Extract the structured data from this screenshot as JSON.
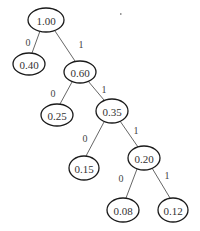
{
  "diagram": {
    "type": "binary-tree",
    "nodes": [
      {
        "id": "n1",
        "label": "1.00",
        "cx": 46,
        "cy": 20,
        "rx": 18,
        "ry": 12
      },
      {
        "id": "n2",
        "label": "0.40",
        "cx": 29,
        "cy": 64,
        "rx": 16,
        "ry": 11
      },
      {
        "id": "n3",
        "label": "0.60",
        "cx": 80,
        "cy": 72,
        "rx": 16,
        "ry": 11
      },
      {
        "id": "n4",
        "label": "0.25",
        "cx": 57,
        "cy": 115,
        "rx": 16,
        "ry": 11
      },
      {
        "id": "n5",
        "label": "0.35",
        "cx": 112,
        "cy": 111,
        "rx": 16,
        "ry": 12
      },
      {
        "id": "n6",
        "label": "0.15",
        "cx": 84,
        "cy": 168,
        "rx": 15,
        "ry": 12
      },
      {
        "id": "n7",
        "label": "0.20",
        "cx": 144,
        "cy": 158,
        "rx": 16,
        "ry": 12
      },
      {
        "id": "n8",
        "label": "0.08",
        "cx": 123,
        "cy": 210,
        "rx": 16,
        "ry": 12
      },
      {
        "id": "n9",
        "label": "0.12",
        "cx": 173,
        "cy": 210,
        "rx": 15,
        "ry": 12
      }
    ],
    "edges": [
      {
        "from": "n1",
        "to": "n2",
        "label": "0",
        "x1": 40,
        "y1": 31,
        "x2": 32,
        "y2": 53,
        "lx": 28,
        "ly": 42
      },
      {
        "from": "n1",
        "to": "n3",
        "label": "1",
        "x1": 55,
        "y1": 31,
        "x2": 75,
        "y2": 61,
        "lx": 81,
        "ly": 44
      },
      {
        "from": "n3",
        "to": "n4",
        "label": "0",
        "x1": 72,
        "y1": 82,
        "x2": 60,
        "y2": 104,
        "lx": 53,
        "ly": 93
      },
      {
        "from": "n3",
        "to": "n5",
        "label": "1",
        "x1": 88,
        "y1": 81,
        "x2": 104,
        "y2": 100,
        "lx": 104,
        "ly": 89
      },
      {
        "from": "n5",
        "to": "n6",
        "label": "0",
        "x1": 104,
        "y1": 122,
        "x2": 86,
        "y2": 156,
        "lx": 85,
        "ly": 138
      },
      {
        "from": "n5",
        "to": "n7",
        "label": "1",
        "x1": 120,
        "y1": 121,
        "x2": 138,
        "y2": 147,
        "lx": 136,
        "ly": 130
      },
      {
        "from": "n7",
        "to": "n8",
        "label": "0",
        "x1": 137,
        "y1": 169,
        "x2": 126,
        "y2": 198,
        "lx": 121,
        "ly": 178
      },
      {
        "from": "n7",
        "to": "n9",
        "label": "1",
        "x1": 152,
        "y1": 168,
        "x2": 170,
        "y2": 198,
        "lx": 167,
        "ly": 175
      }
    ]
  }
}
